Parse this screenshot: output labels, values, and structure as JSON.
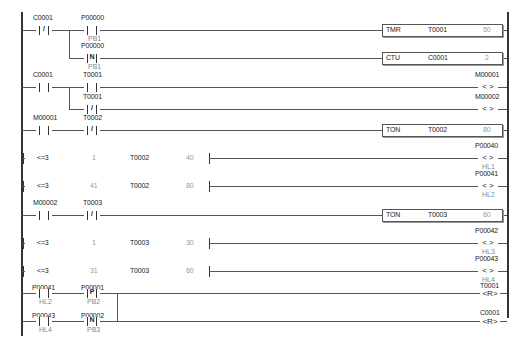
{
  "rungs": [
    {
      "contacts": [
        {
          "addr": "C0001",
          "type": "NC"
        },
        {
          "addr": "P00000",
          "type": "NO",
          "comment": "PB1"
        }
      ],
      "branch": [
        {
          "addr": "P00000",
          "type": "N",
          "comment": "PB1"
        }
      ],
      "outputs": [
        {
          "type": "TMR",
          "addr": "T0001",
          "value": "50"
        },
        {
          "type": "CTU",
          "addr": "C0001",
          "value": "2"
        }
      ]
    },
    {
      "contacts": [
        {
          "addr": "C0001",
          "type": "NO"
        },
        {
          "addr": "T0001",
          "type": "NO"
        }
      ],
      "branch": [
        {
          "addr": "T0001",
          "type": "NC"
        }
      ],
      "outputs": [
        {
          "type": "coil",
          "addr": "M00001",
          "symbol": "< >"
        },
        {
          "type": "coil",
          "addr": "M00002",
          "symbol": "< >"
        }
      ]
    },
    {
      "contacts": [
        {
          "addr": "M00001",
          "type": "NO"
        },
        {
          "addr": "T0002",
          "type": "NC"
        }
      ],
      "outputs": [
        {
          "type": "TON",
          "addr": "T0002",
          "value": "80"
        }
      ]
    },
    {
      "compare": {
        "op": "<=3",
        "a": "1",
        "addr": "T0002",
        "b": "40"
      },
      "output": {
        "addr": "P00040",
        "symbol": "< >",
        "comment": "HL1"
      }
    },
    {
      "compare": {
        "op": "<=3",
        "a": "41",
        "addr": "T0002",
        "b": "80"
      },
      "output": {
        "addr": "P00041",
        "symbol": "< >",
        "comment": "HL2"
      }
    },
    {
      "contacts": [
        {
          "addr": "M00002",
          "type": "NO"
        },
        {
          "addr": "T0003",
          "type": "NC"
        }
      ],
      "outputs": [
        {
          "type": "TON",
          "addr": "T0003",
          "value": "60"
        }
      ]
    },
    {
      "compare": {
        "op": "<=3",
        "a": "1",
        "addr": "T0003",
        "b": "30"
      },
      "output": {
        "addr": "P00042",
        "symbol": "< >",
        "comment": "HL3"
      }
    },
    {
      "compare": {
        "op": "<=3",
        "a": "31",
        "addr": "T0003",
        "b": "60"
      },
      "output": {
        "addr": "P00043",
        "symbol": "< >",
        "comment": "HL4"
      }
    },
    {
      "contacts": [
        {
          "addr": "P00041",
          "type": "NO",
          "comment": "HL2"
        },
        {
          "addr": "P00001",
          "type": "P",
          "comment": "PB2"
        }
      ],
      "branch": [
        {
          "addr": "P00043",
          "type": "NO",
          "comment": "HL4"
        },
        {
          "addr": "P00002",
          "type": "N",
          "comment": "PB3"
        }
      ],
      "outputs": [
        {
          "type": "reset",
          "addr": "T0001",
          "symbol": "<R>"
        },
        {
          "type": "reset",
          "addr": "C0001",
          "symbol": "<R>"
        }
      ]
    }
  ],
  "glyphs": {
    "NO": "",
    "NC": "/",
    "P": "P",
    "N": "N"
  }
}
